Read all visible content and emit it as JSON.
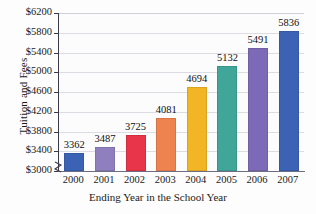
{
  "chart_data": {
    "type": "bar",
    "title": "",
    "xlabel": "Ending Year in the School Year",
    "ylabel": "Tuition and Fees",
    "categories": [
      "2000",
      "2001",
      "2002",
      "2003",
      "2004",
      "2005",
      "2006",
      "2007"
    ],
    "values": [
      3362,
      3487,
      3725,
      4081,
      4694,
      5132,
      5491,
      5836
    ],
    "value_labels": [
      "3362",
      "3487",
      "3725",
      "4081",
      "4694",
      "5132",
      "5491",
      "5836"
    ],
    "ylim": [
      3000,
      6200
    ],
    "ytick_labels": [
      "$6200",
      "$5800",
      "$5400",
      "$5000",
      "$4600",
      "$4200",
      "$3800",
      "$3400",
      "$3000"
    ],
    "ytick_values": [
      6200,
      5800,
      5400,
      5000,
      4600,
      4200,
      3800,
      3400,
      3000
    ],
    "grid": true,
    "legend": "none",
    "y_axis_break": true,
    "bar_colors": [
      "#3b62b5",
      "#8f7fbe",
      "#e8354a",
      "#ef8350",
      "#f2b625",
      "#3fa699",
      "#7c6ab8",
      "#3b62b5"
    ]
  }
}
